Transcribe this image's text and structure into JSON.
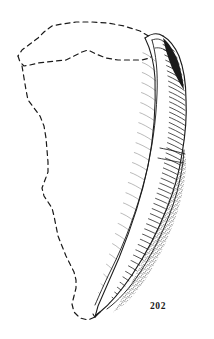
{
  "figure": {
    "number": "202",
    "caption_number": "202",
    "background_color": "#ffffff",
    "ink_color": "#1a1a1a",
    "type": "scientific line illustration",
    "reconstruction_note": "left and upper body shown as dashed reconstructed outline; preserved fragment shown with hatched and stippled shading at right"
  },
  "elements": {
    "reconstructed_outline": {
      "name": "dashed reconstruction outline",
      "style": "dashed",
      "stroke_color": "#1a1a1a",
      "stroke_width": 1.2,
      "dash_pattern": "5 4"
    },
    "preserved_fragment": {
      "name": "preserved fragment body",
      "style": "solid contour with dense parallel hatching",
      "stroke_color": "#1a1a1a",
      "stroke_width": 1.1
    },
    "shading": {
      "hatching": "dense parallel curved hatch lines following the surface curvature",
      "stipple": "granular stippled band along outer convex edge",
      "dark_notch": "solid black shaded notch near the proximal (upper) end"
    }
  }
}
